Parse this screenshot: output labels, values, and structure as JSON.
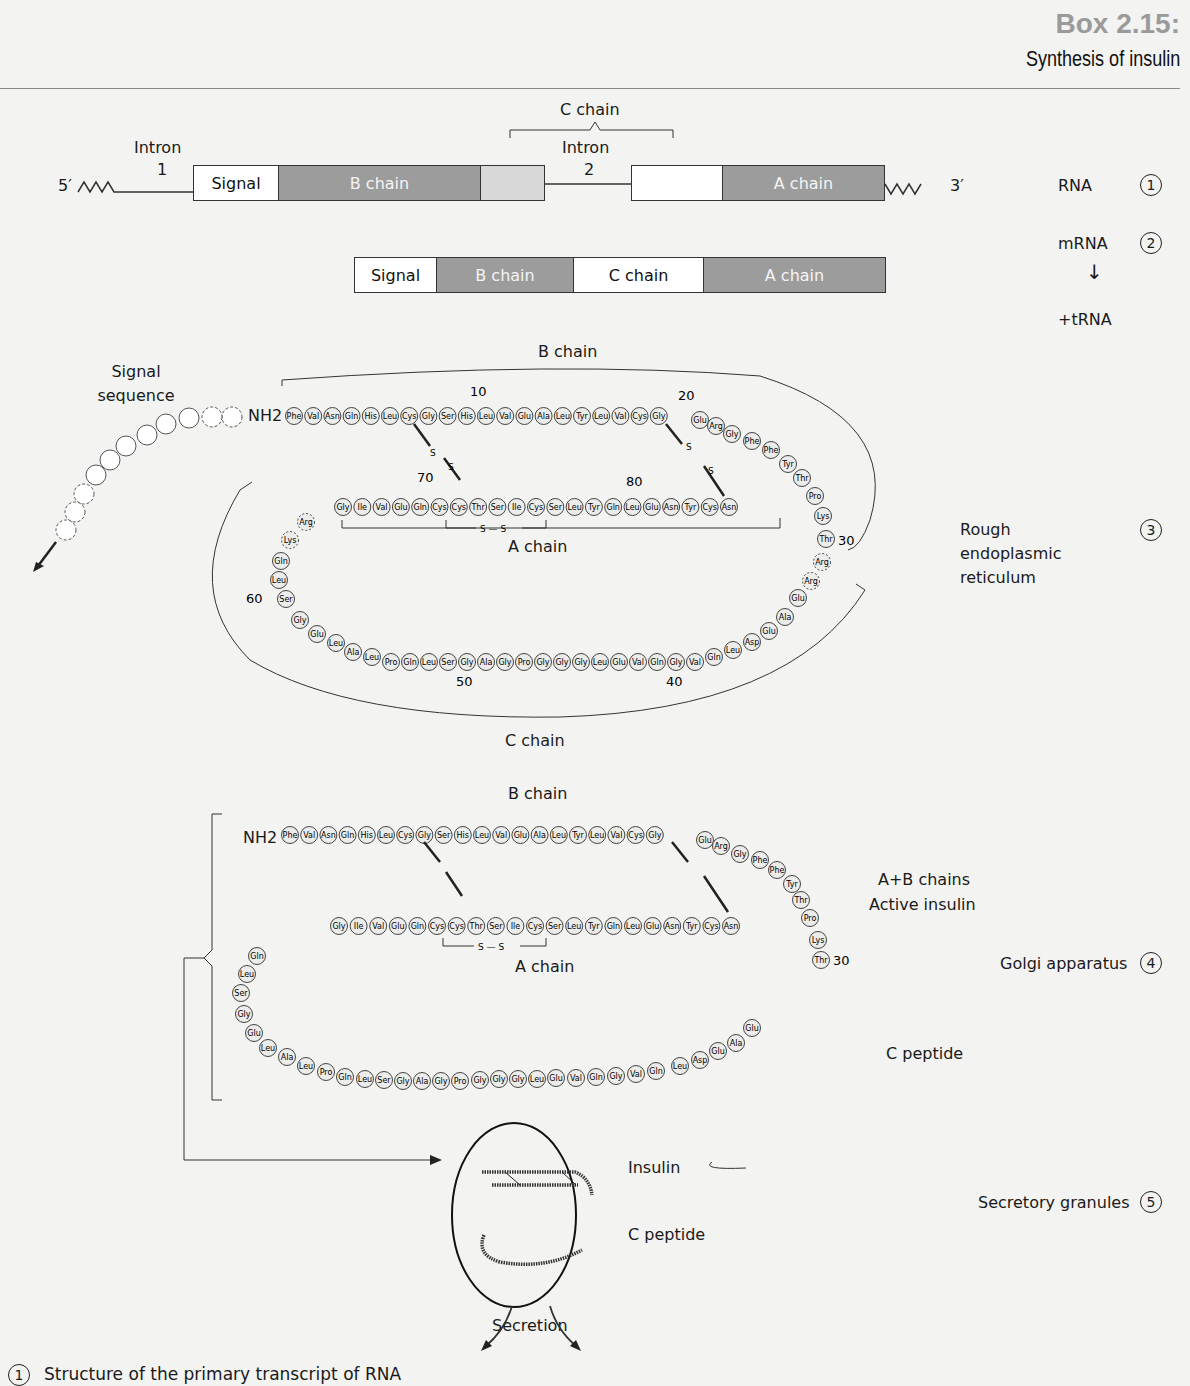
{
  "header": {
    "box_number": "Box 2.15:",
    "title": "Synthesis of insulin"
  },
  "gene": {
    "five_prime": "5′",
    "three_prime": "3′",
    "intron1_label": "Intron",
    "intron1_num": "1",
    "intron2_label": "Intron",
    "intron2_num": "2",
    "c_chain_bracket": "C chain",
    "segments": [
      "Signal",
      "B chain",
      "",
      "",
      "A chain"
    ]
  },
  "mrna": {
    "segments": [
      "Signal",
      "B chain",
      "C chain",
      "A chain"
    ]
  },
  "steps": [
    {
      "label": "RNA",
      "num": "1"
    },
    {
      "label": "mRNA",
      "num": "2"
    },
    {
      "label": "+tRNA",
      "num": ""
    },
    {
      "label": "Rough endoplasmic reticulum",
      "num": "3"
    },
    {
      "label": "Golgi apparatus",
      "num": "4"
    },
    {
      "label": "Secretory granules",
      "num": "5"
    }
  ],
  "er": {
    "signal_label": "Signal sequence",
    "nh2": "NH2",
    "b_chain_label": "B chain",
    "a_chain_label": "A chain",
    "c_chain_label": "C chain",
    "b_chain": [
      "Phe",
      "Val",
      "Asn",
      "Gln",
      "His",
      "Leu",
      "Cys",
      "Gly",
      "Ser",
      "His",
      "Leu",
      "Val",
      "Glu",
      "Ala",
      "Leu",
      "Tyr",
      "Leu",
      "Val",
      "Cys",
      "Gly",
      "Glu",
      "Arg",
      "Gly",
      "Phe",
      "Phe",
      "Tyr",
      "Thr",
      "Pro",
      "Lys",
      "Thr"
    ],
    "c_peptide": [
      "Arg",
      "Arg",
      "Glu",
      "Ala",
      "Glu",
      "Asp",
      "Leu",
      "Gln",
      "Val",
      "Gly",
      "Gln",
      "Val",
      "Glu",
      "Leu",
      "Gly",
      "Gly",
      "Gly",
      "Pro",
      "Gly",
      "Ala",
      "Gly",
      "Ser",
      "Leu",
      "Gln",
      "Pro",
      "Leu",
      "Ala",
      "Leu",
      "Glu",
      "Gly",
      "Ser",
      "Leu",
      "Gln",
      "Lys",
      "Arg"
    ],
    "a_chain": [
      "Gly",
      "Ile",
      "Val",
      "Glu",
      "Gln",
      "Cys",
      "Cys",
      "Thr",
      "Ser",
      "Ile",
      "Cys",
      "Ser",
      "Leu",
      "Tyr",
      "Gln",
      "Leu",
      "Glu",
      "Asn",
      "Tyr",
      "Cys",
      "Asn"
    ],
    "numbers": [
      "10",
      "20",
      "30",
      "40",
      "50",
      "60",
      "70",
      "80"
    ],
    "disulfide": "S"
  },
  "golgi": {
    "b_chain_label": "B chain",
    "a_chain_label": "A chain",
    "nh2": "NH2",
    "active_label_1": "A+B chains",
    "active_label_2": "Active insulin",
    "c_peptide_label": "C peptide",
    "thr30": "30"
  },
  "granule": {
    "insulin": "Insulin",
    "c_peptide": "C peptide",
    "secretion": "Secretion"
  },
  "footnote": {
    "num": "1",
    "text": "Structure of the primary transcript of RNA"
  }
}
